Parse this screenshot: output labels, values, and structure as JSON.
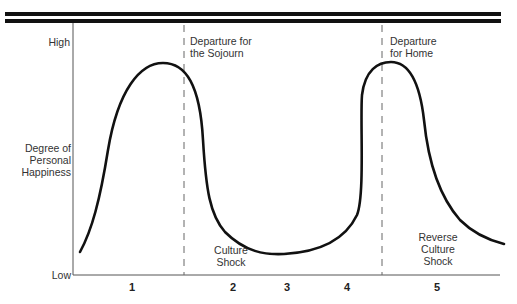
{
  "diagram": {
    "title": "",
    "y_axis": {
      "label_lines": [
        "Degree of",
        "Personal",
        "Happiness"
      ],
      "high": "High",
      "low": "Low"
    },
    "markers": [
      {
        "label_lines": [
          "Departure for",
          "the Sojourn"
        ]
      },
      {
        "label_lines": [
          "Departure",
          "for Home"
        ]
      }
    ],
    "annotations": [
      {
        "label_lines": [
          "Culture",
          "Shock"
        ]
      },
      {
        "label_lines": [
          "Reverse",
          "Culture",
          "Shock"
        ]
      }
    ],
    "stages": [
      "1",
      "2",
      "3",
      "4",
      "5"
    ],
    "colors": {
      "line": "#111111",
      "text": "#333333",
      "axis": "#555555"
    }
  }
}
